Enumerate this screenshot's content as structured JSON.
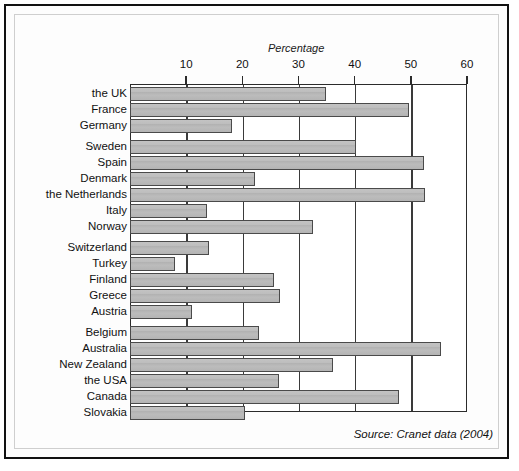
{
  "figure": {
    "source_note": "Source: Cranet data (2004)"
  },
  "chart_data": {
    "type": "bar",
    "orientation": "horizontal",
    "title": "",
    "xlabel": "Percentage",
    "ylabel": "",
    "xlim": [
      0,
      60
    ],
    "xticks": [
      10,
      20,
      30,
      40,
      50,
      60
    ],
    "xtick_labels": [
      "10",
      "20",
      "30",
      "40",
      "50",
      "60"
    ],
    "grid": true,
    "grid_axis": "x",
    "legend": null,
    "bar_color": "#b9b9b9",
    "bar_edge_color": "#4a4a4a",
    "categories": [
      "the UK",
      "France",
      "Germany",
      "Sweden",
      "Spain",
      "Denmark",
      "the Netherlands",
      "Italy",
      "Norway",
      "Switzerland",
      "Turkey",
      "Finland",
      "Greece",
      "Austria",
      "Belgium",
      "Australia",
      "New Zealand",
      "the USA",
      "Canada",
      "Slovakia"
    ],
    "values": [
      34.9,
      49.6,
      18.2,
      40.2,
      52.4,
      22.2,
      52.6,
      13.7,
      32.5,
      14.1,
      8.0,
      25.6,
      26.7,
      11.1,
      22.9,
      55.4,
      36.1,
      26.5,
      47.9,
      20.4
    ],
    "group_breaks_after": [
      "Germany",
      "Norway",
      "Austria",
      "Slovakia"
    ]
  }
}
